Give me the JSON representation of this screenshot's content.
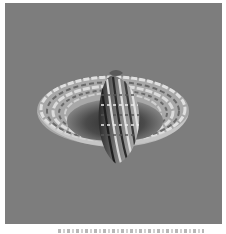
{
  "figure": {
    "type": "3d-surface-render",
    "background_color": "#7d7d7d",
    "colors": {
      "rim_light": "#dcdcdc",
      "rim_mid": "#a9a9a9",
      "rim_dark": "#5e5e5e",
      "bowl_dark": "#3a3a3a",
      "lobe_light": "#c8c8c8",
      "lobe_dark": "#2e2e2e"
    }
  },
  "caption": {
    "text": ""
  }
}
